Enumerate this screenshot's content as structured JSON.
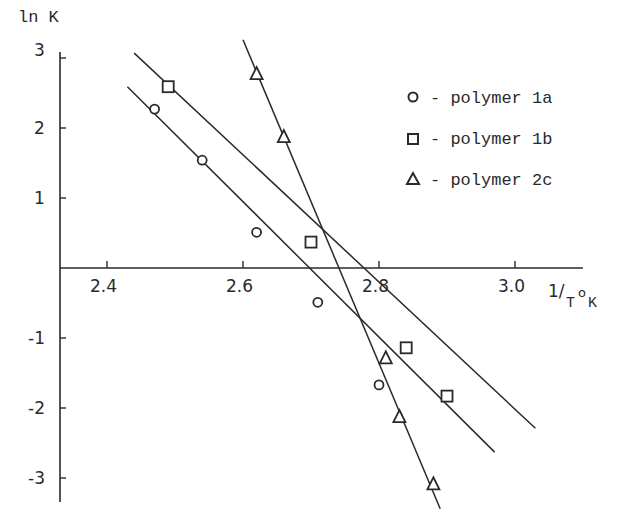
{
  "chart_data": {
    "type": "scatter",
    "title": "",
    "xlabel": "1/T°K",
    "ylabel": "ln K",
    "xlim": [
      2.32,
      3.1
    ],
    "ylim": [
      -3.3,
      3.1
    ],
    "x_ticks": [
      2.4,
      2.6,
      2.8,
      3.0
    ],
    "x_tick_labels": [
      "2.4",
      "2.6",
      "2.8",
      "3.0"
    ],
    "y_ticks": [
      3,
      2,
      1,
      -1,
      -2,
      -3
    ],
    "y_tick_labels": [
      "3",
      "2",
      "1",
      "-1",
      "-2",
      "-3"
    ],
    "grid": false,
    "legend_position": "upper right",
    "series": [
      {
        "name": "polymer 1a",
        "marker": "circle",
        "x": [
          2.47,
          2.54,
          2.62,
          2.71,
          2.8
        ],
        "y": [
          2.27,
          1.54,
          0.51,
          -0.49,
          -1.67
        ],
        "fit_line": {
          "x": [
            2.43,
            2.97
          ],
          "y": [
            2.59,
            -2.63
          ]
        }
      },
      {
        "name": "polymer 1b",
        "marker": "square",
        "x": [
          2.49,
          2.7,
          2.84,
          2.9
        ],
        "y": [
          2.59,
          0.37,
          -1.14,
          -1.83
        ],
        "fit_line": {
          "x": [
            2.44,
            3.03
          ],
          "y": [
            3.07,
            -2.29
          ]
        }
      },
      {
        "name": "polymer 2c",
        "marker": "triangle",
        "x": [
          2.62,
          2.66,
          2.81,
          2.83,
          2.88
        ],
        "y": [
          2.77,
          1.87,
          -1.29,
          -2.13,
          -3.09
        ],
        "fit_line": {
          "x": [
            2.6,
            2.89
          ],
          "y": [
            3.26,
            -3.44
          ]
        }
      }
    ]
  },
  "axes": {
    "y_label": "ln K",
    "x_label_num": "1/",
    "x_label_T": "T",
    "x_label_deg": "o",
    "x_label_K": "K"
  },
  "legend": [
    {
      "symbol": "circle",
      "text": "- polymer 1a"
    },
    {
      "symbol": "square",
      "text": "- polymer 1b"
    },
    {
      "symbol": "triangle",
      "text": "- polymer 2c"
    }
  ],
  "ticks": {
    "x": [
      "2.4",
      "2.6",
      "2.8",
      "3.0"
    ],
    "y": [
      "3",
      "2",
      "1",
      "-1",
      "-2",
      "-3"
    ]
  }
}
